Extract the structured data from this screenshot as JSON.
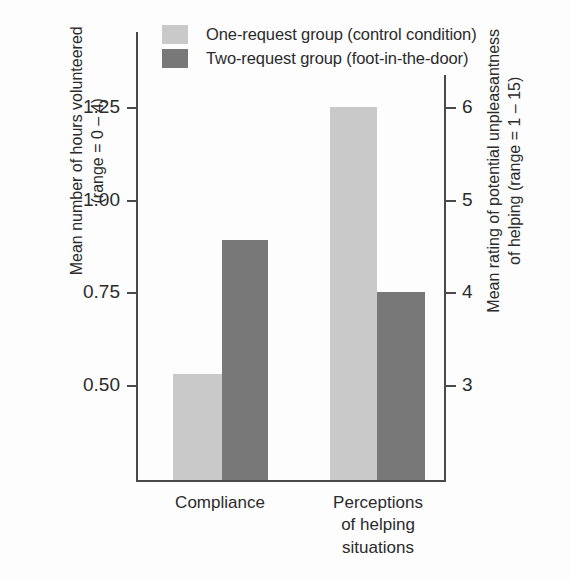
{
  "chart_data": {
    "type": "bar",
    "title": "",
    "subtitle": "",
    "categories": [
      "Compliance",
      "Perceptions\nof helping\nsituations"
    ],
    "series": [
      {
        "name": "One-request group (control condition)",
        "color": "#c9c9c9",
        "values": [
          0.53,
          6.0
        ]
      },
      {
        "name": "Two-request group (foot-in-the-door)",
        "color": "#787878",
        "values": [
          0.89,
          4.0
        ]
      }
    ],
    "xlabel": "",
    "grid": false,
    "legend_position": "top-left",
    "axes": {
      "left": {
        "title": "Mean number of hours volunteered\n(range = 0 – 4)",
        "ticks": [
          "1.25",
          "1.00",
          "0.75",
          "0.50"
        ],
        "tick_values": [
          1.25,
          1.0,
          0.75,
          0.5
        ],
        "range_note": "range = 0 – 4"
      },
      "right": {
        "title": "Mean rating of potential unpleasantness\nof helping (range = 1 – 15)",
        "ticks": [
          "6",
          "5",
          "4",
          "3"
        ],
        "tick_values": [
          6,
          5,
          4,
          3
        ],
        "range_note": "range = 1 – 15"
      }
    }
  },
  "legend": {
    "items": [
      {
        "label": "One-request group (control condition)",
        "color": "#c9c9c9"
      },
      {
        "label": "Two-request group (foot-in-the-door)",
        "color": "#787878"
      }
    ]
  },
  "axis_left": {
    "title": "Mean number of hours volunteered\n(range = 0 – 4)",
    "tick_1": "1.25",
    "tick_2": "1.00",
    "tick_3": "0.75",
    "tick_4": "0.50"
  },
  "axis_right": {
    "title": "Mean rating of potential unpleasantness\nof helping (range = 1 – 15)",
    "tick_1": "6",
    "tick_2": "5",
    "tick_3": "4",
    "tick_4": "3"
  },
  "categories": {
    "group_1": "Compliance",
    "group_2": "Perceptions\nof helping\nsituations"
  }
}
